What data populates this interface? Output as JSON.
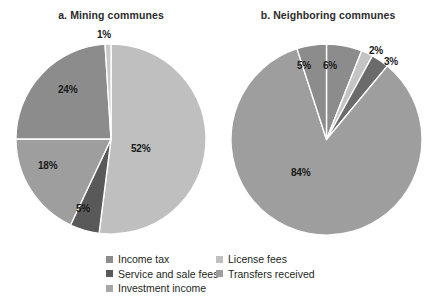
{
  "figure": {
    "background": "#ffffff",
    "label_color": "#1a1a1a"
  },
  "palette": {
    "income_tax": "#8c8c8c",
    "service_and_sale_fees": "#595959",
    "investment_income": "#a6a6a6",
    "license_fees": "#bfbfbf",
    "transfers_received": "#9e9e9e",
    "slice_divider": "#ffffff"
  },
  "legend": {
    "position": "bottom-center",
    "columns": [
      {
        "items": [
          {
            "label": "Income tax",
            "color": "#8c8c8c",
            "swatch_name": "legend-swatch-income-tax"
          },
          {
            "label": "Service and sale fees",
            "color": "#595959",
            "swatch_name": "legend-swatch-service-and-sale-fees"
          },
          {
            "label": "Investment income",
            "color": "#a6a6a6",
            "swatch_name": "legend-swatch-investment-income"
          }
        ]
      },
      {
        "items": [
          {
            "label": "License fees",
            "color": "#bfbfbf",
            "swatch_name": "legend-swatch-license-fees"
          },
          {
            "label": "Transfers received",
            "color": "#9e9e9e",
            "swatch_name": "legend-swatch-transfers-received"
          }
        ]
      }
    ]
  },
  "chart_data": [
    {
      "type": "pie",
      "title": "a. Mining communes",
      "panel": "a",
      "unit": "percent",
      "legend_position": "bottom",
      "labels_on_slices": true,
      "categories": [
        "License fees",
        "Service and sale fees",
        "Transfers received",
        "Income tax",
        "Investment income"
      ],
      "values": [
        52,
        5,
        18,
        24,
        1
      ],
      "value_labels": [
        "52%",
        "5%",
        "18%",
        "24%",
        "1%"
      ],
      "colors": [
        "#bfbfbf",
        "#595959",
        "#9e9e9e",
        "#8c8c8c",
        "#c9c9c9"
      ],
      "start_angle_deg": 0,
      "direction": "clockwise"
    },
    {
      "type": "pie",
      "title": "b. Neighboring communes",
      "panel": "b",
      "unit": "percent",
      "legend_position": "bottom",
      "labels_on_slices": true,
      "categories": [
        "Income tax",
        "License fees",
        "Service and sale fees",
        "Transfers received",
        "Investment income"
      ],
      "values": [
        6,
        2,
        3,
        84,
        5
      ],
      "value_labels": [
        "6%",
        "2%",
        "3%",
        "84%",
        "5%"
      ],
      "colors": [
        "#8c8c8c",
        "#c4c4c4",
        "#6b6b6b",
        "#9e9e9e",
        "#8c8c8c"
      ],
      "start_angle_deg": 0,
      "direction": "clockwise"
    }
  ],
  "slice_label_positions": {
    "pie_a": [
      {
        "text": "52%",
        "left": 131,
        "top": 143
      },
      {
        "text": "5%",
        "left": 76,
        "top": 203
      },
      {
        "text": "18%",
        "left": 38,
        "top": 160
      },
      {
        "text": "24%",
        "left": 58,
        "top": 84
      },
      {
        "text": "1%",
        "left": 97,
        "top": 29
      }
    ],
    "pie_b": [
      {
        "text": "6%",
        "left": 323,
        "top": 60
      },
      {
        "text": "2%",
        "left": 369,
        "top": 45
      },
      {
        "text": "3%",
        "left": 384,
        "top": 56
      },
      {
        "text": "84%",
        "left": 291,
        "top": 167
      },
      {
        "text": "5%",
        "left": 297,
        "top": 60
      }
    ]
  }
}
